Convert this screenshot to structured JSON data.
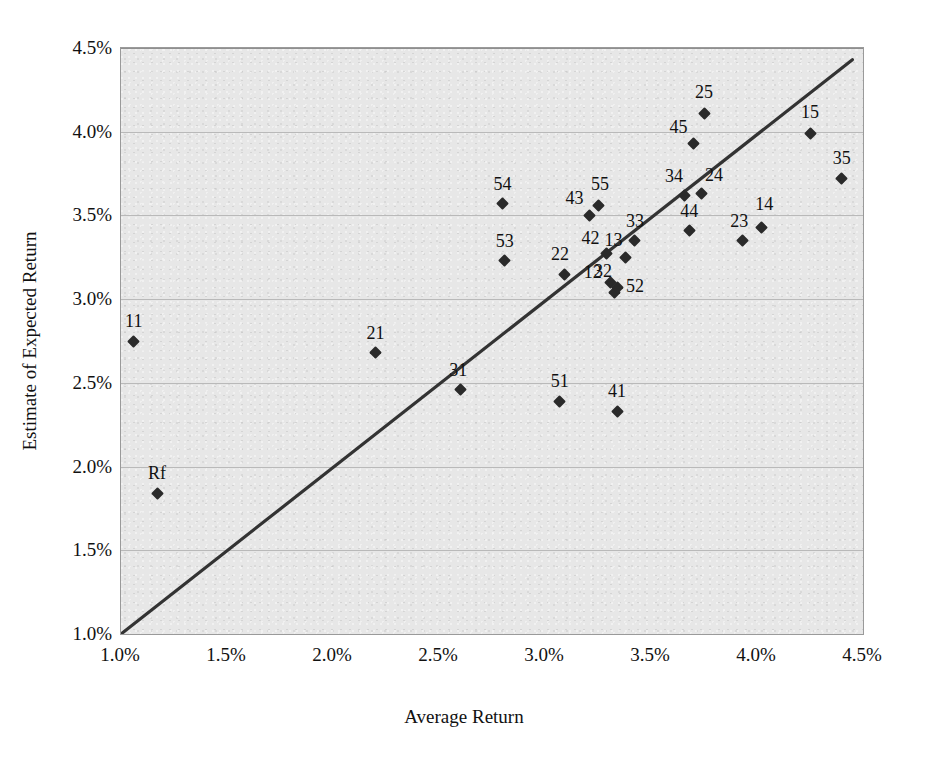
{
  "chart_data": {
    "type": "scatter",
    "title": "",
    "xlabel": "Average Return",
    "ylabel": "Estimate of Expected Return",
    "xlim": [
      1.0,
      4.5
    ],
    "ylim": [
      1.0,
      4.5
    ],
    "xticks": [
      "1.0%",
      "1.5%",
      "2.0%",
      "2.5%",
      "3.0%",
      "3.5%",
      "4.0%",
      "4.5%"
    ],
    "xtick_values": [
      1.0,
      1.5,
      2.0,
      2.5,
      3.0,
      3.5,
      4.0,
      4.5
    ],
    "yticks": [
      "1.0%",
      "1.5%",
      "2.0%",
      "2.5%",
      "3.0%",
      "3.5%",
      "4.0%",
      "4.5%"
    ],
    "ytick_values": [
      1.0,
      1.5,
      2.0,
      2.5,
      3.0,
      3.5,
      4.0,
      4.5
    ],
    "grid": "horizontal",
    "legend": "none",
    "plot_background": "#e7e7e7",
    "marker": "diamond",
    "marker_color": "#2a2a2a",
    "line_color": "#333333",
    "reference_line": {
      "label": "45-degree line",
      "x": [
        1.0,
        4.45
      ],
      "y": [
        1.0,
        4.43
      ]
    },
    "points": [
      {
        "label": "11",
        "x": 1.06,
        "y": 2.75
      },
      {
        "label": "Rf",
        "x": 1.17,
        "y": 1.84
      },
      {
        "label": "21",
        "x": 2.2,
        "y": 2.68
      },
      {
        "label": "31",
        "x": 2.6,
        "y": 2.46
      },
      {
        "label": "54",
        "x": 2.8,
        "y": 3.57
      },
      {
        "label": "53",
        "x": 2.81,
        "y": 3.23
      },
      {
        "label": "51",
        "x": 3.07,
        "y": 2.39
      },
      {
        "label": "22",
        "x": 3.09,
        "y": 3.15
      },
      {
        "label": "43",
        "x": 3.21,
        "y": 3.5
      },
      {
        "label": "55",
        "x": 3.25,
        "y": 3.56
      },
      {
        "label": "42",
        "x": 3.29,
        "y": 3.27
      },
      {
        "label": "12",
        "x": 3.31,
        "y": 3.1
      },
      {
        "label": "41",
        "x": 3.34,
        "y": 2.33
      },
      {
        "label": "52",
        "x": 3.33,
        "y": 3.04
      },
      {
        "label": "32",
        "x": 3.34,
        "y": 3.07
      },
      {
        "label": "13",
        "x": 3.38,
        "y": 3.25
      },
      {
        "label": "33",
        "x": 3.42,
        "y": 3.35
      },
      {
        "label": "34",
        "x": 3.66,
        "y": 3.62
      },
      {
        "label": "44",
        "x": 3.68,
        "y": 3.41
      },
      {
        "label": "45",
        "x": 3.7,
        "y": 3.93
      },
      {
        "label": "24",
        "x": 3.74,
        "y": 3.63
      },
      {
        "label": "25",
        "x": 3.75,
        "y": 4.11
      },
      {
        "label": "23",
        "x": 3.93,
        "y": 3.35
      },
      {
        "label": "14",
        "x": 4.02,
        "y": 3.43
      },
      {
        "label": "15",
        "x": 4.25,
        "y": 3.99
      },
      {
        "label": "35",
        "x": 4.4,
        "y": 3.72
      }
    ],
    "label_offsets": {
      "11": {
        "dx": 0,
        "dy": -11
      },
      "Rf": {
        "dx": 0,
        "dy": -11
      },
      "21": {
        "dx": 0,
        "dy": -11
      },
      "31": {
        "dx": -2,
        "dy": -11
      },
      "54": {
        "dx": 0,
        "dy": -11
      },
      "53": {
        "dx": 0,
        "dy": -11
      },
      "51": {
        "dx": 0,
        "dy": -11
      },
      "22": {
        "dx": -4,
        "dy": -11
      },
      "43": {
        "dx": -15,
        "dy": -8
      },
      "55": {
        "dx": 2,
        "dy": -12
      },
      "42": {
        "dx": -16,
        "dy": -7
      },
      "12": {
        "dx": -18,
        "dy": -1
      },
      "41": {
        "dx": 0,
        "dy": -11
      },
      "52": {
        "dx": 20,
        "dy": 3
      },
      "32": {
        "dx": -14,
        "dy": -7
      },
      "13": {
        "dx": -12,
        "dy": -8
      },
      "33": {
        "dx": 1,
        "dy": -11
      },
      "34": {
        "dx": -11,
        "dy": -10
      },
      "44": {
        "dx": 0,
        "dy": -10
      },
      "45": {
        "dx": -15,
        "dy": -7
      },
      "24": {
        "dx": 12,
        "dy": -10
      },
      "25": {
        "dx": 0,
        "dy": -12
      },
      "23": {
        "dx": -3,
        "dy": -11
      },
      "14": {
        "dx": 3,
        "dy": -14
      },
      "15": {
        "dx": 0,
        "dy": -12
      },
      "35": {
        "dx": 0,
        "dy": -12
      }
    }
  }
}
